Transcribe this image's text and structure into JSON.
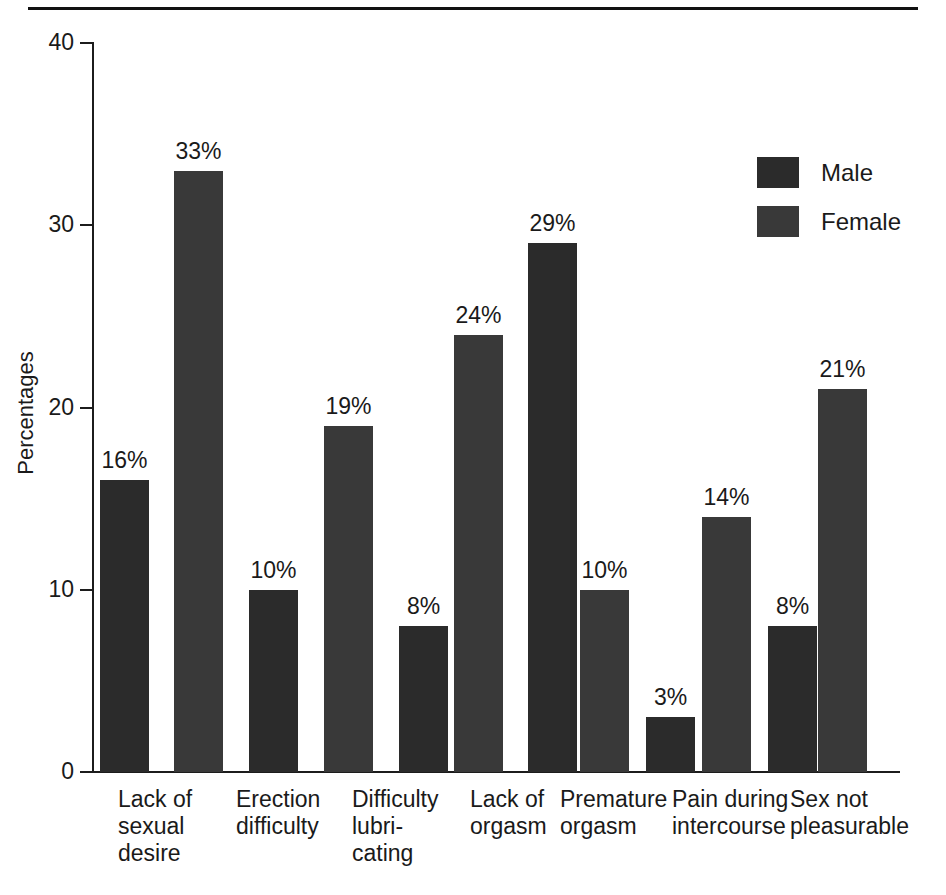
{
  "page": {
    "background_color": "#ffffff",
    "rule_color": "#111111"
  },
  "legend": {
    "position": "top-right",
    "items": [
      {
        "label": "Male",
        "color": "#2b2b2b"
      },
      {
        "label": "Female",
        "color": "#393939"
      }
    ]
  },
  "axis": {
    "y_title": "Percentages",
    "y_ticks": [
      "0",
      "10",
      "20",
      "30",
      "40"
    ]
  },
  "chart_data": {
    "type": "bar",
    "title": "",
    "xlabel": "",
    "ylabel": "Percentages",
    "ylim": [
      0,
      40
    ],
    "yticks": [
      0,
      10,
      20,
      30,
      40
    ],
    "grid": false,
    "legend_position": "top-right",
    "value_suffix": "%",
    "categories": [
      "Lack of sexual desire",
      "Erection difficulty",
      "Difficulty lubricating",
      "Lack of orgasm",
      "Premature orgasm",
      "Pain during intercourse",
      "Sex not pleasurable"
    ],
    "category_lines": [
      [
        "Lack of",
        "sexual",
        "desire"
      ],
      [
        "Erection",
        "difficulty"
      ],
      [
        "Difficulty",
        "lubri-",
        "cating"
      ],
      [
        "Lack of",
        "orgasm"
      ],
      [
        "Premature",
        "orgasm"
      ],
      [
        "Pain during",
        "intercourse"
      ],
      [
        "Sex not",
        "pleasurable"
      ]
    ],
    "series": [
      {
        "name": "Male",
        "color": "#2b2b2b",
        "values": [
          16,
          10,
          null,
          8,
          29,
          3,
          8
        ],
        "labels": [
          "16%",
          "10%",
          null,
          "8%",
          "29%",
          "3%",
          "8%"
        ]
      },
      {
        "name": "Female",
        "color": "#393939",
        "values": [
          33,
          null,
          19,
          24,
          10,
          14,
          21
        ],
        "labels": [
          "33%",
          null,
          "19%",
          "24%",
          "10%",
          "14%",
          "21%"
        ]
      }
    ]
  },
  "bars": [
    {
      "key": "b0",
      "series": "Male",
      "category": "Lack of sexual desire",
      "value": 16,
      "label": "16%",
      "x": 100,
      "w": 49
    },
    {
      "key": "b1",
      "series": "Female",
      "category": "Lack of sexual desire",
      "value": 33,
      "label": "33%",
      "x": 174,
      "w": 49
    },
    {
      "key": "b2",
      "series": "Male",
      "category": "Erection difficulty",
      "value": 10,
      "label": "10%",
      "x": 249,
      "w": 49
    },
    {
      "key": "b3",
      "series": "Female",
      "category": "Difficulty lubricating",
      "value": 19,
      "label": "19%",
      "x": 324,
      "w": 49
    },
    {
      "key": "b4",
      "series": "Male",
      "category": "Lack of orgasm",
      "value": 8,
      "label": "8%",
      "x": 399,
      "w": 49
    },
    {
      "key": "b5",
      "series": "Female",
      "category": "Lack of orgasm",
      "value": 24,
      "label": "24%",
      "x": 454,
      "w": 49
    },
    {
      "key": "b6",
      "series": "Male",
      "category": "Premature orgasm",
      "value": 29,
      "label": "29%",
      "x": 528,
      "w": 49
    },
    {
      "key": "b7",
      "series": "Female",
      "category": "Premature orgasm",
      "value": 10,
      "label": "10%",
      "x": 580,
      "w": 49
    },
    {
      "key": "b8",
      "series": "Male",
      "category": "Pain during intercourse",
      "value": 3,
      "label": "3%",
      "x": 646,
      "w": 49
    },
    {
      "key": "b9",
      "series": "Female",
      "category": "Pain during intercourse",
      "value": 14,
      "label": "14%",
      "x": 702,
      "w": 49
    },
    {
      "key": "b10",
      "series": "Male",
      "category": "Sex not pleasurable",
      "value": 8,
      "label": "8%",
      "x": 768,
      "w": 49
    },
    {
      "key": "b11",
      "series": "Female",
      "category": "Sex not pleasurable",
      "value": 21,
      "label": "21%",
      "x": 818,
      "w": 49
    }
  ],
  "category_positions": [
    {
      "lines": [
        "Lack of",
        "sexual",
        "desire"
      ],
      "x": 118
    },
    {
      "lines": [
        "Erection",
        "difficulty"
      ],
      "x": 236
    },
    {
      "lines": [
        "Difficulty",
        "lubri-",
        "cating"
      ],
      "x": 352
    },
    {
      "lines": [
        "Lack of",
        "orgasm"
      ],
      "x": 470
    },
    {
      "lines": [
        "Premature",
        "orgasm"
      ],
      "x": 560
    },
    {
      "lines": [
        "Pain during",
        "intercourse"
      ],
      "x": 672
    },
    {
      "lines": [
        "Sex not",
        "pleasurable"
      ],
      "x": 790
    }
  ]
}
